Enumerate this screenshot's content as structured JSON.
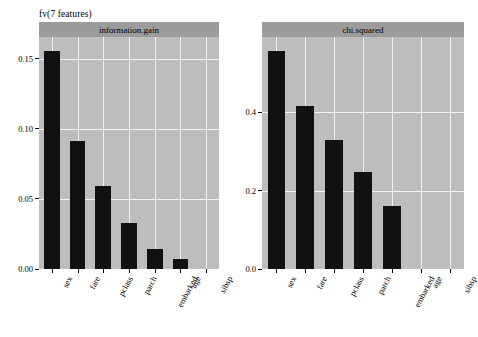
{
  "figure": {
    "title": "fv(7 features)",
    "panel_fill": "#bdbdbd",
    "strip_fill": "#9c9c9c",
    "grid_color": "#f2f2f2",
    "bar_color": "#111111",
    "background": "#ffffff"
  },
  "chart_data": {
    "type": "bar",
    "title": "fv(7 features)",
    "xlabel": "",
    "ylabel": "",
    "grid": true,
    "legend": "none",
    "orientation": "vertical",
    "categories": [
      "sex",
      "fare",
      "pclass",
      "parch",
      "embarked",
      "age",
      "sibsp"
    ],
    "panels": [
      {
        "name": "information.gain",
        "strip_label": "information.gain",
        "values": [
          0.1557,
          0.0915,
          0.0592,
          0.0331,
          0.0141,
          0.007,
          0.0
        ],
        "ylim": [
          0.0,
          0.1655
        ],
        "yticks": [
          0.0,
          0.05,
          0.1,
          0.15
        ],
        "ytick_labels": [
          "0.00",
          "0.05",
          "0.10",
          "0.15"
        ]
      },
      {
        "name": "chi.squared",
        "strip_label": "chi.squared",
        "values": [
          0.557,
          0.415,
          0.329,
          0.248,
          0.16,
          0.0,
          0.0
        ],
        "ylim": [
          0.0,
          0.592
        ],
        "yticks": [
          0.0,
          0.2,
          0.4
        ],
        "ytick_labels": [
          "0.0",
          "0.2",
          "0.4"
        ]
      }
    ]
  }
}
